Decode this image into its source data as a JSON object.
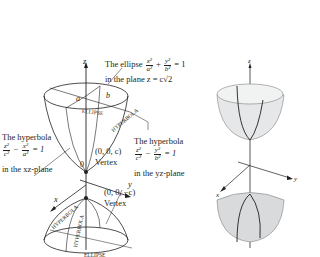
{
  "left_figure": {
    "axis_labels": {
      "z": "z",
      "x": "x",
      "y": "y",
      "origin": "0"
    },
    "semi_axis_labels": {
      "a": "a",
      "b": "b"
    },
    "curve_labels": {
      "ellipse_top": "ELLIPSE",
      "hyperbola_top": "HYPERBOLA",
      "hyperbola_bottom_left": "HYPERBOLA",
      "hyperbola_bottom_center": "HYPERBOLA",
      "ellipse_bottom": "ELLIPSE"
    },
    "ellipse_annotation": {
      "prefix": "The ellipse",
      "frac1_num": "x²",
      "frac1_den": "a²",
      "plus": "+",
      "frac2_num": "y²",
      "frac2_den": "b²",
      "equals": "= 1",
      "line2": "in the plane z = c√2"
    },
    "hyperbola_xz": {
      "title": "The hyperbola",
      "frac1_num": "z²",
      "frac1_den": "c²",
      "minus": "−",
      "frac2_num": "x²",
      "frac2_den": "a²",
      "equals": "= 1",
      "plane": "in the xz-plane"
    },
    "hyperbola_yz": {
      "title": "The hyperbola",
      "frac1_num": "z²",
      "frac1_den": "c²",
      "minus": "−",
      "frac2_num": "y²",
      "frac2_den": "b²",
      "equals": "= 1",
      "plane": "in the yz-plane"
    },
    "vertex_top": {
      "coords": "(0, 0, c)",
      "label": "Vertex"
    },
    "vertex_bottom": {
      "coords": "(0, 0, −c)",
      "label": "Vertex"
    }
  },
  "right_figure": {
    "axis_labels": {
      "z": "z",
      "x": "x",
      "y": "y"
    },
    "surface_color": "#e6e7e8",
    "surface_shade": "#cfd1d3"
  },
  "colors": {
    "ink": "#231f20",
    "axis": "#58595b",
    "background": "#ffffff"
  }
}
